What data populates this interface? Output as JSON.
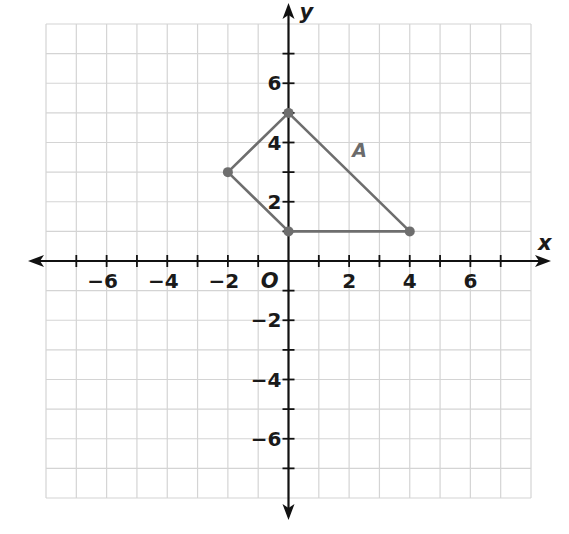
{
  "chart_data": {
    "type": "scatter",
    "title": "",
    "xlabel": "x",
    "ylabel": "y",
    "xlim": [
      -8,
      8
    ],
    "ylim": [
      -8,
      8
    ],
    "grid": true,
    "x_ticks": [
      -6,
      -4,
      -2,
      2,
      4,
      6
    ],
    "y_ticks": [
      6,
      4,
      2,
      -2,
      -4,
      -6
    ],
    "x_tick_labels": [
      "−6",
      "−4",
      "−2",
      "2",
      "4",
      "6"
    ],
    "y_tick_labels": [
      "6",
      "4",
      "2",
      "−2",
      "−4",
      "−6"
    ],
    "origin_label": "O",
    "series": [
      {
        "name": "A",
        "closed": true,
        "points": [
          [
            0,
            5
          ],
          [
            4,
            1
          ],
          [
            0,
            1
          ],
          [
            -2,
            3
          ]
        ]
      }
    ]
  },
  "colors": {
    "grid": "#d4d4d4",
    "axis": "#111111",
    "shape": "#6e6e6e"
  }
}
